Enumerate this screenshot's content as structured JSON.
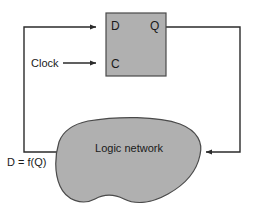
{
  "diagram": {
    "colors": {
      "shape_fill": "#b0b0b0",
      "shape_stroke": "#4a4a4a",
      "wire": "#2b2b2b",
      "text": "#1a1a1a",
      "background": "#ffffff"
    },
    "flipflop": {
      "name": "D flip-flop",
      "input_d_label": "D",
      "input_c_label": "C",
      "output_q_label": "Q",
      "bounds": {
        "x": 106,
        "y": 13,
        "width": 60,
        "height": 63
      }
    },
    "logic_network": {
      "label": "Logic network",
      "bounds": {
        "x": 57,
        "y": 118,
        "width": 143,
        "height": 90
      }
    },
    "signals": {
      "clock_label": "Clock",
      "feedback_label": "D = f(Q)"
    },
    "wires": [
      {
        "name": "q-to-logic-network",
        "from": "Q output",
        "to": "Logic network right edge",
        "arrowhead": "left"
      },
      {
        "name": "logic-network-to-d",
        "from": "Logic network left edge",
        "to": "D input",
        "arrowhead": "right"
      },
      {
        "name": "clock-to-c",
        "from": "Clock",
        "to": "C input",
        "arrowhead": "right"
      }
    ]
  }
}
